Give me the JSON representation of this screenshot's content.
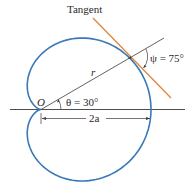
{
  "diagram": {
    "type": "polar-curve",
    "curve": "cardioid",
    "labels": {
      "tangent": "Tangent",
      "psi": "ψ = 75°",
      "theta": "θ = 30°",
      "origin": "O",
      "radius": "r",
      "diameter": "2a"
    },
    "values": {
      "theta_deg": 30,
      "psi_deg": 75
    },
    "colors": {
      "curve": "#3a78b8",
      "tangent": "#e0873a",
      "lines": "#3a3a3a",
      "text": "#2a2a2a"
    }
  }
}
